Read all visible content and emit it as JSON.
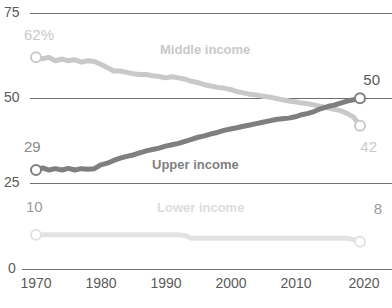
{
  "chart_data": {
    "type": "line",
    "title": "",
    "xlabel": "",
    "ylabel": "",
    "xlim": [
      1970,
      2020
    ],
    "ylim": [
      0,
      75
    ],
    "grid": true,
    "legend_position": "inline-annotations",
    "y_ticks": [
      "0",
      "25",
      "50",
      "75"
    ],
    "y_tick_values": [
      0,
      25,
      50,
      75
    ],
    "x_ticks": [
      "1970",
      "1980",
      "1990",
      "2000",
      "2010",
      "2020"
    ],
    "x_tick_values": [
      1970,
      1980,
      1990,
      2000,
      2010,
      2020
    ],
    "x": [
      1971,
      1972,
      1973,
      1974,
      1975,
      1976,
      1977,
      1978,
      1979,
      1980,
      1981,
      1982,
      1983,
      1984,
      1985,
      1986,
      1987,
      1988,
      1989,
      1990,
      1991,
      1992,
      1993,
      1994,
      1995,
      1996,
      1997,
      1998,
      1999,
      2000,
      2001,
      2002,
      2003,
      2004,
      2005,
      2006,
      2007,
      2008,
      2009,
      2010,
      2011,
      2012,
      2013,
      2014,
      2015,
      2016,
      2017,
      2018,
      2019,
      2020,
      2021
    ],
    "series": [
      {
        "name": "Middle income",
        "label": "Middle income",
        "color": "#c9c9c9",
        "start_label": "62%",
        "end_label": "42",
        "start_value": 62,
        "end_value": 42,
        "values": [
          62,
          61.6,
          62,
          61,
          61.5,
          61,
          61.3,
          60.6,
          61,
          60.8,
          60,
          59,
          58,
          58,
          57.6,
          57.2,
          57,
          57,
          56.6,
          56.4,
          56,
          56.3,
          56,
          55.6,
          55,
          54.6,
          54,
          53.6,
          53.2,
          53,
          52.6,
          52,
          51.6,
          51.2,
          51,
          50.6,
          50.4,
          50,
          49.6,
          49.2,
          49,
          48.6,
          48.4,
          48,
          47.6,
          47.2,
          46.8,
          46.4,
          45.6,
          44.5,
          42
        ]
      },
      {
        "name": "Upper income",
        "label": "Upper income",
        "color": "#7f7f7f",
        "start_label": "29",
        "end_label": "50",
        "start_value": 29,
        "end_value": 50,
        "values": [
          29,
          29.6,
          29,
          29.4,
          29,
          29.5,
          29,
          29.4,
          29.2,
          29.4,
          30.5,
          31,
          31.8,
          32.5,
          33,
          33.4,
          34,
          34.6,
          35,
          35.4,
          36,
          36.4,
          36.8,
          37.4,
          38,
          38.6,
          39,
          39.6,
          40,
          40.6,
          41,
          41.4,
          41.8,
          42.2,
          42.6,
          43,
          43.4,
          43.8,
          44,
          44.2,
          44.6,
          45.2,
          45.6,
          46.2,
          47,
          47.6,
          48,
          48.6,
          49.2,
          49.6,
          50
        ]
      },
      {
        "name": "Lower income",
        "label": "Lower income",
        "color": "#e2e2e2",
        "start_label": "10",
        "end_label": "8",
        "start_value": 10,
        "end_value": 8,
        "values": [
          10,
          10,
          10,
          10,
          10,
          10,
          10,
          10,
          10,
          10,
          10,
          10,
          10,
          10,
          10,
          10,
          10,
          10,
          10,
          10,
          10,
          10,
          10,
          9.8,
          9,
          9,
          9,
          9,
          9,
          9,
          9,
          9,
          9,
          9,
          9,
          9,
          9,
          9,
          9,
          9,
          9,
          9,
          9,
          9,
          9,
          9,
          9,
          9,
          9,
          8.6,
          8
        ]
      }
    ],
    "annotations": [
      {
        "text": "Middle income",
        "color": "#c9c9c9"
      },
      {
        "text": "Upper income",
        "color": "#7f7f7f"
      },
      {
        "text": "Lower income",
        "color": "#e2e2e2"
      }
    ]
  },
  "source_note": ""
}
